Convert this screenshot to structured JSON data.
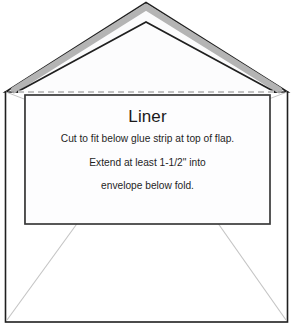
{
  "diagram": {
    "name": "envelope-liner-template-diagram",
    "title": "Liner",
    "instructions": [
      "Cut to fit below glue strip at top of flap.",
      "Extend at least 1-1/2\" into",
      "envelope below fold."
    ],
    "measurement": "1-1/2\"",
    "colors": {
      "background": "#ffffff",
      "outline": "#1f1f1f",
      "liner_border": "#3a3a3a",
      "glue_strip": "#b4b4b4",
      "fold_line": "#8c8c8c",
      "guide_line": "#c4c4c4",
      "flap_fill": "#fbfbfc",
      "body_fill": "#ffffff",
      "liner_fill": "#fdfdfe",
      "text": "#1a1a1a"
    },
    "geometry": {
      "canvas": {
        "width": 292,
        "height": 332
      },
      "envelope_body": {
        "left": 5,
        "top": 92,
        "right": 288,
        "bottom": 322
      },
      "flap_outer": {
        "apex_x": 146,
        "apex_y": 2,
        "left_x": 5,
        "right_x": 288,
        "base_y": 92
      },
      "flap_inner": {
        "apex_x": 146,
        "apex_y": 22,
        "left_x": 18,
        "right_x": 275,
        "base_y": 92
      },
      "glue_strip": {
        "apex_x": 146,
        "apex_y": 12,
        "left_x": 11,
        "right_x": 281,
        "base_y": 90,
        "thickness": 6
      },
      "fold_line_y": 92,
      "liner_rect": {
        "left": 25,
        "top": 95,
        "right": 270,
        "bottom": 224
      },
      "bottom_flap_apex": {
        "left_x": 5,
        "right_x": 288,
        "y": 322
      }
    },
    "parts": {
      "flap": "envelope-flap",
      "glue_strip": "glue-strip",
      "fold_line": "fold-line",
      "liner": "liner-rectangle",
      "body": "envelope-body",
      "bottom_flap": "bottom-flap-guides",
      "side_flap_left": "left-side-flap-guide",
      "side_flap_right": "right-side-flap-guide"
    }
  }
}
